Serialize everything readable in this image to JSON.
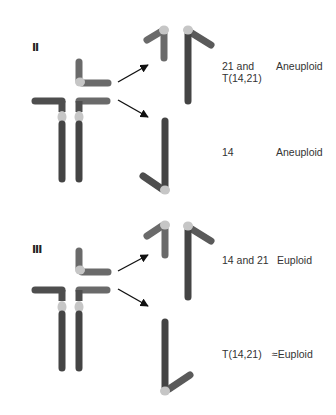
{
  "colors": {
    "dark_chromosome": "#4a4a4a",
    "medium_chromosome": "#6e6e6e",
    "centromere": "#c8c8c8",
    "arrow": "#111111",
    "text": "#333333",
    "background": "#ffffff"
  },
  "sections": [
    {
      "numeral": "II",
      "outcomes": [
        {
          "chromosomes": "21 and\nT(14,21)",
          "result": "Aneuploid"
        },
        {
          "chromosomes": "14",
          "result": "Aneuploid"
        }
      ]
    },
    {
      "numeral": "III",
      "outcomes": [
        {
          "chromosomes": "14 and 21",
          "result": "Euploid"
        },
        {
          "chromosomes": "T(14,21)",
          "result": "≈Euploid"
        }
      ]
    }
  ]
}
